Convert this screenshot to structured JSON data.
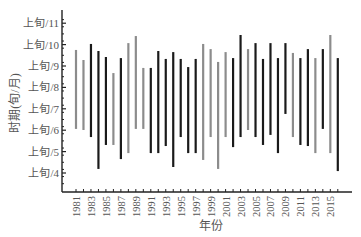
{
  "chart_data": {
    "type": "bar",
    "subtype": "floating-range",
    "title": "",
    "xlabel": "年份",
    "ylabel": "时期(旬/月)",
    "ylim": [
      3.15,
      11.5
    ],
    "y_ticks": [
      {
        "value": 4,
        "label": "上旬/4"
      },
      {
        "value": 5,
        "label": "上旬/5"
      },
      {
        "value": 6,
        "label": "上旬/6"
      },
      {
        "value": 7,
        "label": "上旬/7"
      },
      {
        "value": 8,
        "label": "上旬/8"
      },
      {
        "value": 9,
        "label": "上旬/9"
      },
      {
        "value": 10,
        "label": "上旬/10"
      },
      {
        "value": 11,
        "label": "上旬/11"
      }
    ],
    "x_tick_labels": [
      "1981",
      "1983",
      "1985",
      "1987",
      "1989",
      "1991",
      "1993",
      "1995",
      "1997",
      "1999",
      "2001",
      "2003",
      "2005",
      "2007",
      "2009",
      "2011",
      "2013",
      "2015"
    ],
    "grid": false,
    "legend": null,
    "colors": {
      "black": "#1a1a1a",
      "gray": "#8c8c8c"
    },
    "categories": [
      1981,
      1982,
      1983,
      1984,
      1985,
      1986,
      1987,
      1988,
      1989,
      1990,
      1991,
      1992,
      1993,
      1994,
      1995,
      1996,
      1997,
      1998,
      1999,
      2000,
      2001,
      2002,
      2003,
      2004,
      2005,
      2006,
      2007,
      2008,
      2009,
      2010,
      2011,
      2012,
      2013,
      2014,
      2015,
      2016
    ],
    "series": [
      {
        "name": "start",
        "values": [
          6.06,
          6.01,
          5.68,
          4.19,
          5.31,
          5.31,
          4.65,
          4.93,
          6.06,
          6.06,
          4.93,
          4.93,
          5.26,
          4.28,
          5.68,
          4.93,
          4.93,
          4.61,
          5.68,
          4.19,
          5.68,
          5.21,
          5.68,
          6.01,
          5.68,
          5.31,
          5.78,
          4.93,
          6.76,
          5.68,
          5.31,
          5.26,
          4.93,
          6.06,
          4.93,
          4.09
        ]
      },
      {
        "name": "end",
        "values": [
          9.75,
          9.28,
          10.03,
          9.7,
          9.42,
          8.67,
          9.37,
          10.07,
          10.4,
          8.91,
          8.91,
          9.7,
          9.33,
          9.65,
          9.33,
          8.95,
          9.33,
          10.03,
          9.79,
          9.19,
          9.65,
          9.37,
          10.45,
          9.79,
          10.07,
          9.33,
          10.07,
          9.37,
          10.07,
          9.61,
          9.37,
          9.79,
          9.37,
          9.79,
          10.45,
          9.37
        ]
      }
    ],
    "bar_color_class": [
      "gray",
      "gray",
      "black",
      "black",
      "black",
      "gray",
      "black",
      "gray",
      "gray",
      "gray",
      "black",
      "black",
      "black",
      "black",
      "black",
      "black",
      "black",
      "gray",
      "gray",
      "gray",
      "gray",
      "black",
      "black",
      "gray",
      "black",
      "black",
      "black",
      "black",
      "black",
      "gray",
      "black",
      "black",
      "gray",
      "black",
      "gray",
      "black"
    ]
  }
}
